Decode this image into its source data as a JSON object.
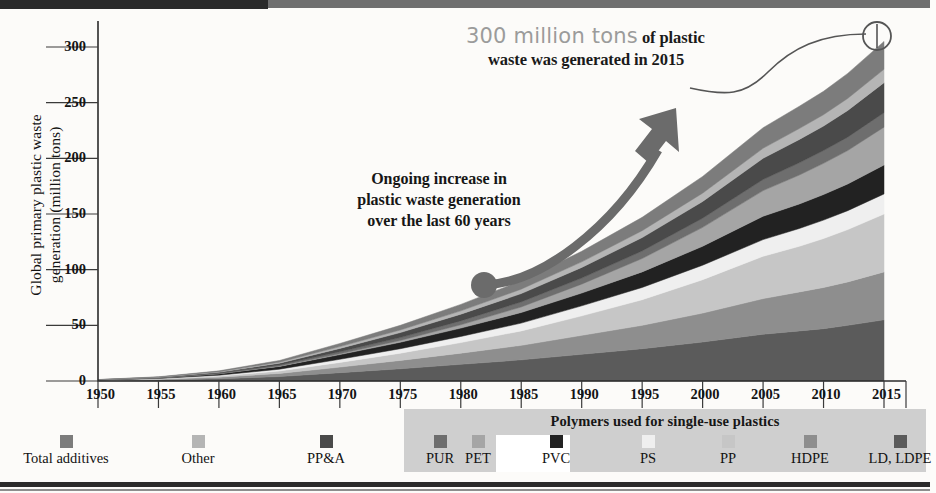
{
  "chart_data": {
    "type": "area",
    "title": "",
    "xlabel": "",
    "ylabel": "Global primary plastic waste generation (million tons)",
    "xlim": [
      1950,
      2015
    ],
    "ylim": [
      0,
      320
    ],
    "yticks": [
      0,
      50,
      100,
      150,
      200,
      250,
      300
    ],
    "xticks": [
      1950,
      1955,
      1960,
      1965,
      1970,
      1975,
      1980,
      1985,
      1990,
      1995,
      2000,
      2005,
      2010,
      2015
    ],
    "grid": false,
    "legend_position": "bottom",
    "stacked": true,
    "x": [
      1950,
      1955,
      1960,
      1965,
      1970,
      1975,
      1980,
      1985,
      1990,
      1995,
      2000,
      2005,
      2008,
      2010,
      2012,
      2015
    ],
    "series": [
      {
        "name": "LD, LDPE",
        "color": "#5b5b5b",
        "values": [
          0.3,
          0.9,
          2.0,
          4.0,
          7.5,
          11.0,
          15.0,
          19.0,
          24.0,
          29.0,
          35.0,
          42.0,
          45.0,
          47.0,
          50.0,
          55.0
        ]
      },
      {
        "name": "HDPE",
        "color": "#8e8e8e",
        "values": [
          0.2,
          0.6,
          1.4,
          2.8,
          5.0,
          7.5,
          10.0,
          13.0,
          17.0,
          21.0,
          26.0,
          32.0,
          35.0,
          37.0,
          39.0,
          43.0
        ]
      },
      {
        "name": "PP",
        "color": "#c6c6c6",
        "values": [
          0.1,
          0.4,
          1.0,
          2.2,
          4.2,
          6.5,
          9.5,
          13.0,
          17.5,
          23.0,
          30.0,
          38.0,
          41.0,
          44.0,
          47.0,
          52.0
        ]
      },
      {
        "name": "PS",
        "color": "#efefef",
        "values": [
          0.1,
          0.3,
          0.8,
          1.6,
          2.8,
          4.0,
          5.5,
          7.0,
          9.0,
          11.0,
          13.0,
          15.0,
          16.0,
          16.5,
          17.0,
          18.0
        ]
      },
      {
        "name": "PVC",
        "color": "#222222",
        "values": [
          0.2,
          0.6,
          1.3,
          2.5,
          4.2,
          5.8,
          7.5,
          9.5,
          11.5,
          14.0,
          17.0,
          21.0,
          22.0,
          23.0,
          24.0,
          26.0
        ]
      },
      {
        "name": "PET",
        "color": "#a5a5a5",
        "values": [
          0.0,
          0.0,
          0.1,
          0.3,
          0.8,
          1.6,
          3.0,
          5.0,
          8.0,
          12.0,
          17.0,
          23.0,
          26.0,
          28.0,
          30.0,
          34.0
        ]
      },
      {
        "name": "PUR",
        "color": "#6e6e6e",
        "values": [
          0.1,
          0.2,
          0.5,
          1.0,
          1.8,
          2.6,
          3.5,
          4.5,
          5.5,
          6.8,
          8.2,
          10.0,
          11.0,
          11.5,
          12.0,
          13.0
        ]
      },
      {
        "name": "PP&A",
        "color": "#4a4a4a",
        "values": [
          0.1,
          0.3,
          0.8,
          1.6,
          3.0,
          4.5,
          6.0,
          7.5,
          9.5,
          12.0,
          15.0,
          19.0,
          21.0,
          22.0,
          24.0,
          27.0
        ]
      },
      {
        "name": "Other",
        "color": "#b5b5b5",
        "values": [
          0.1,
          0.2,
          0.5,
          0.9,
          1.6,
          2.3,
          3.0,
          4.0,
          5.0,
          6.2,
          7.5,
          9.0,
          9.8,
          10.2,
          10.8,
          12.0
        ]
      },
      {
        "name": "Total additives",
        "color": "#7c7c7c",
        "values": [
          0.1,
          0.3,
          0.7,
          1.5,
          2.8,
          4.2,
          5.8,
          7.5,
          9.5,
          12.0,
          15.0,
          18.5,
          20.0,
          21.0,
          22.5,
          25.0
        ]
      }
    ],
    "total_2015": 300,
    "annotations": [
      {
        "id": "callout-2015",
        "text_strong": "300 million tons",
        "text_rest": "of plastic waste was generated in 2015",
        "at_year": 2015
      },
      {
        "id": "trend-note",
        "text": "Ongoing increase in plastic waste generation over the last 60 years"
      }
    ]
  },
  "yaxis": {
    "title_line1": "Global primary plastic waste",
    "title_line2": "generation (million tons)",
    "ticks": [
      "300",
      "250",
      "200",
      "150",
      "100",
      "50",
      "0"
    ]
  },
  "xaxis": {
    "ticks": [
      "1950",
      "1955",
      "1960",
      "1965",
      "1970",
      "1975",
      "1980",
      "1985",
      "1990",
      "1995",
      "2000",
      "2005",
      "2010",
      "2015"
    ]
  },
  "callout": {
    "big": "300 million tons",
    "rest": " of plastic",
    "line2": "waste was generated in 2015"
  },
  "note": {
    "line1": "Ongoing increase in",
    "line2": "plastic waste generation",
    "line3": "over the last 60 years"
  },
  "legend": {
    "group_title": "Polymers used for single-use plastics",
    "items": [
      {
        "label": "Total additives",
        "color": "#7c7c7c",
        "highlight": false
      },
      {
        "label": "Other",
        "color": "#b5b5b5",
        "highlight": false
      },
      {
        "label": "PP&A",
        "color": "#4a4a4a",
        "highlight": false
      },
      {
        "label": "PUR",
        "color": "#6e6e6e",
        "highlight": false
      },
      {
        "label": "PET",
        "color": "#a5a5a5",
        "highlight": false
      },
      {
        "label": "PVC",
        "color": "#222222",
        "highlight": true
      },
      {
        "label": "PS",
        "color": "#efefef",
        "highlight": false
      },
      {
        "label": "PP",
        "color": "#c6c6c6",
        "highlight": false
      },
      {
        "label": "HDPE",
        "color": "#8e8e8e",
        "highlight": false
      },
      {
        "label": "LD, LDPE",
        "color": "#5b5b5b",
        "highlight": false
      }
    ]
  },
  "colors": {
    "axis": "#2b2b2b",
    "arrow": "#6b6b6b",
    "callout_gray": "#9b9b9b",
    "legend_group_bg": "#cfcfcf",
    "page_bg": "#fcfbf9"
  }
}
